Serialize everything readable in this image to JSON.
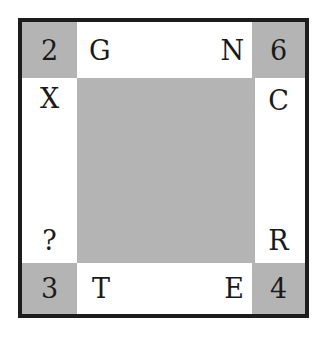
{
  "puzzle": {
    "corners": {
      "top_left": "2",
      "top_right": "6",
      "bottom_left": "3",
      "bottom_right": "4"
    },
    "top_row": {
      "left": "G",
      "right": "N"
    },
    "bottom_row": {
      "left": "T",
      "right": "E"
    },
    "left_col": {
      "top": "X",
      "bottom": "?"
    },
    "right_col": {
      "top": "C",
      "bottom": "R"
    }
  },
  "colors": {
    "shade": "#b4b4b4",
    "border": "#1c1c1c",
    "text": "#1a1a1a"
  }
}
